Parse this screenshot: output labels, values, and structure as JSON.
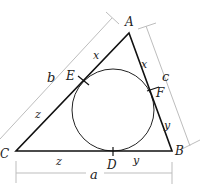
{
  "diagram": {
    "colors": {
      "triangle": "#111111",
      "circle": "#222222",
      "dimension": "#bdbdbd",
      "label": "#222222"
    },
    "vertices": [
      {
        "id": "A",
        "label": "A",
        "x": 129,
        "y": 33
      },
      {
        "id": "B",
        "label": "B",
        "x": 172,
        "y": 151
      },
      {
        "id": "C",
        "label": "C",
        "x": 16,
        "y": 151
      }
    ],
    "incircle": {
      "cx": 113,
      "cy": 110,
      "r": 41
    },
    "tangent_points": [
      {
        "id": "D",
        "label": "D",
        "on_side": "CB"
      },
      {
        "id": "E",
        "label": "E",
        "on_side": "CA"
      },
      {
        "id": "F",
        "label": "F",
        "on_side": "AB"
      }
    ],
    "segment_labels": [
      {
        "id": "x-AE",
        "label": "x",
        "segment": "AE"
      },
      {
        "id": "x-AF",
        "label": "x",
        "segment": "AF"
      },
      {
        "id": "y-FB",
        "label": "y",
        "segment": "FB"
      },
      {
        "id": "y-DB",
        "label": "y",
        "segment": "DB"
      },
      {
        "id": "z-CE",
        "label": "z",
        "segment": "CE"
      },
      {
        "id": "z-CD",
        "label": "z",
        "segment": "CD"
      }
    ],
    "side_dimensions": [
      {
        "id": "a",
        "label": "a",
        "side": "CB"
      },
      {
        "id": "b",
        "label": "b",
        "side": "CA"
      },
      {
        "id": "c",
        "label": "c",
        "side": "AB"
      }
    ]
  }
}
